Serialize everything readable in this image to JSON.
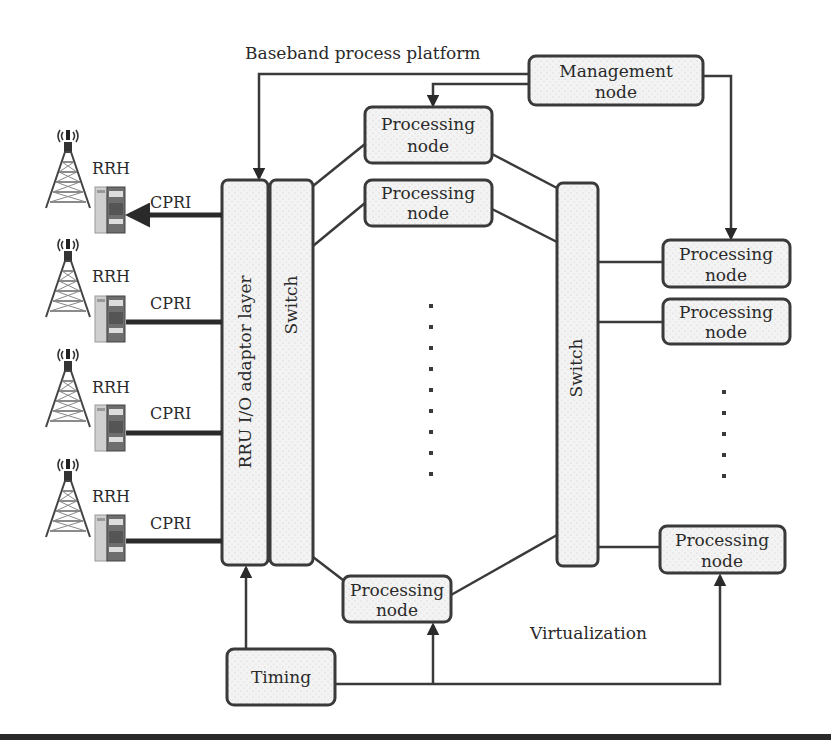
{
  "title": "Baseband process platform",
  "virtualization_label": "Virtualization",
  "management_node": {
    "line1": "Management",
    "line2": "node"
  },
  "rru_layer": {
    "label": "RRU I/O adaptor layer"
  },
  "left_switch": {
    "label": "Switch"
  },
  "right_switch": {
    "label": "Switch"
  },
  "timing": {
    "label": "Timing"
  },
  "processing_nodes": [
    {
      "line1": "Processing",
      "line2": "node"
    },
    {
      "line1": "Processing",
      "line2": "node"
    },
    {
      "line1": "Processing",
      "line2": "node"
    },
    {
      "line1": "Processing",
      "line2": "node"
    },
    {
      "line1": "Processing",
      "line2": "node"
    },
    {
      "line1": "Processing",
      "line2": "node"
    }
  ],
  "rrh_units": [
    {
      "label": "RRH",
      "link": "CPRI"
    },
    {
      "label": "RRH",
      "link": "CPRI"
    },
    {
      "label": "RRH",
      "link": "CPRI"
    },
    {
      "label": "RRH",
      "link": "CPRI"
    }
  ],
  "colors": {
    "stroke": "#3a3a3a",
    "box_fill": "#f2f2f2",
    "text": "#2a2a2a"
  }
}
